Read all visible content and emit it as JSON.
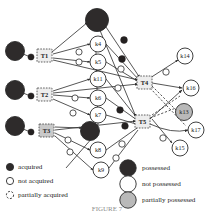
{
  "figure": {
    "caption": "FIGURE 7"
  },
  "legend_left": {
    "name": "acquisition-legend",
    "items": [
      {
        "label": "acquired",
        "swatch": "filled-black-circle",
        "color": "#2e2b2b"
      },
      {
        "label": "not acquired",
        "swatch": "empty-white-circle",
        "color": "#ffffff"
      },
      {
        "label": "partially acquired",
        "swatch": "dashed-white-circle",
        "color": "#ffffff"
      }
    ]
  },
  "legend_right": {
    "name": "possession-legend",
    "items": [
      {
        "label": "possessed",
        "swatch": "filled-dark-circle",
        "color": "#2e2b2b"
      },
      {
        "label": "not possessed",
        "swatch": "empty-white-circle",
        "color": "#ffffff"
      },
      {
        "label": "partially possessed",
        "swatch": "filled-gray-circle",
        "color": "#b9b9b9"
      }
    ]
  },
  "graph": {
    "task_nodes": [
      {
        "id": "T1",
        "label": "T1",
        "state": "partially acquired",
        "x": 45,
        "y": 56
      },
      {
        "id": "T2",
        "label": "T2",
        "state": "partially acquired",
        "x": 45,
        "y": 95
      },
      {
        "id": "T3",
        "label": "T3",
        "state": "partially acquired",
        "x": 47,
        "y": 131
      },
      {
        "id": "T4",
        "label": "T4",
        "state": "partially acquired",
        "x": 145,
        "y": 83
      },
      {
        "id": "T5",
        "label": "T5",
        "state": "partially acquired",
        "x": 143,
        "y": 122
      }
    ],
    "knowledge_nodes": [
      {
        "id": "k4",
        "label": "k4",
        "state": "not possessed",
        "x": 98,
        "y": 44
      },
      {
        "id": "k5",
        "label": "k5",
        "state": "not possessed",
        "x": 98,
        "y": 62
      },
      {
        "id": "k11",
        "label": "k11",
        "state": "not possessed",
        "x": 98,
        "y": 79
      },
      {
        "id": "k6",
        "label": "k6",
        "state": "not possessed",
        "x": 98,
        "y": 98
      },
      {
        "id": "k7",
        "label": "k7",
        "state": "not possessed",
        "x": 98,
        "y": 115
      },
      {
        "id": "k8",
        "label": "k8",
        "state": "not possessed",
        "x": 98,
        "y": 150
      },
      {
        "id": "k9",
        "label": "k9",
        "state": "not possessed",
        "x": 101,
        "y": 170
      },
      {
        "id": "k13",
        "label": "k13",
        "state": "partially possessed",
        "x": 184,
        "y": 112
      },
      {
        "id": "k14",
        "label": "k14",
        "state": "not possessed",
        "x": 185,
        "y": 56
      },
      {
        "id": "k15",
        "label": "k15",
        "state": "not possessed",
        "x": 180,
        "y": 148
      },
      {
        "id": "k16",
        "label": "k16",
        "state": "not possessed",
        "x": 191,
        "y": 88
      },
      {
        "id": "k17",
        "label": "k17",
        "state": "not possessed",
        "x": 196,
        "y": 130
      }
    ],
    "possessed_nodes": [
      {
        "id": "p-top",
        "state": "possessed",
        "x": 97,
        "y": 20
      },
      {
        "id": "p-left1",
        "state": "possessed",
        "x": 15,
        "y": 51
      },
      {
        "id": "p-left2",
        "state": "possessed",
        "x": 15,
        "y": 90
      },
      {
        "id": "p-left3",
        "state": "possessed",
        "x": 15,
        "y": 126
      },
      {
        "id": "p-mid",
        "state": "possessed",
        "x": 90,
        "y": 131
      }
    ],
    "edge_markers_acquired": 7,
    "edge_markers_not_acquired": 12
  }
}
